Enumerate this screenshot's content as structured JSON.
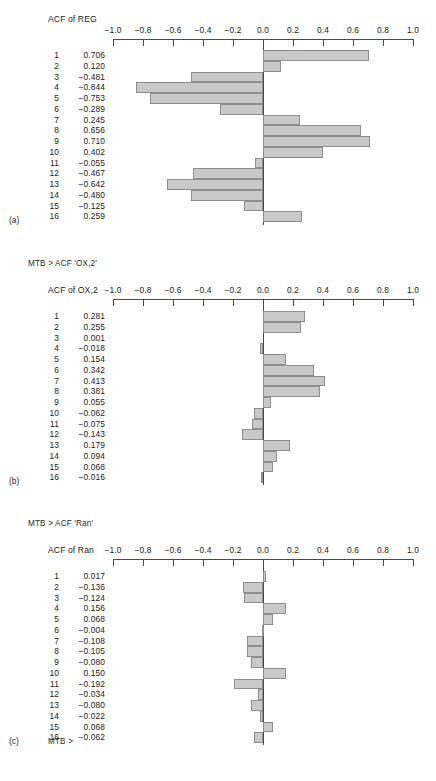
{
  "document": {
    "type": "minitab-acf-output",
    "axis": {
      "tick_labels": [
        "−1.0",
        "−0.8",
        "−0.6",
        "−0.4",
        "−0.2",
        "0.0",
        "0.2",
        "0.4",
        "0.6",
        "0.8",
        "1.0"
      ],
      "min": -1.0,
      "max": 1.0,
      "step": 0.2
    },
    "colors": {
      "bar_fill": "#c9c9c9",
      "bar_stroke": "#8e8e8e",
      "axis": "#4a4a4a",
      "text": "#1a1a1a"
    }
  },
  "panels": [
    {
      "letter": "(a)",
      "mtb_command": "",
      "axis_title": "ACF of REG",
      "chart_data": {
        "type": "bar",
        "orientation": "horizontal",
        "title": "ACF of REG",
        "xlabel": "",
        "ylabel": "Lag",
        "xlim": [
          -1.0,
          1.0
        ],
        "grid": false,
        "legend": "none",
        "categories": [
          "1",
          "2",
          "3",
          "4",
          "5",
          "6",
          "7",
          "8",
          "9",
          "10",
          "11",
          "12",
          "13",
          "14",
          "15",
          "16"
        ],
        "values": [
          0.706,
          0.12,
          -0.481,
          -0.844,
          -0.753,
          -0.289,
          0.245,
          0.656,
          0.71,
          0.402,
          -0.055,
          -0.467,
          -0.642,
          -0.48,
          -0.125,
          0.259
        ],
        "value_labels": [
          "0.706",
          "0.120",
          "−0.481",
          "−0.844",
          "−0.753",
          "−0.289",
          "0.245",
          "0.656",
          "0.710",
          "0.402",
          "−0.055",
          "−0.467",
          "−0.642",
          "−0.480",
          "−0.125",
          "0.259"
        ]
      }
    },
    {
      "letter": "(b)",
      "mtb_command": "MTB > ACF 'OX,2'",
      "axis_title": "ACF of OX,2",
      "chart_data": {
        "type": "bar",
        "orientation": "horizontal",
        "title": "ACF of OX,2",
        "xlabel": "",
        "ylabel": "Lag",
        "xlim": [
          -1.0,
          1.0
        ],
        "grid": false,
        "legend": "none",
        "categories": [
          "1",
          "2",
          "3",
          "4",
          "5",
          "6",
          "7",
          "8",
          "9",
          "10",
          "11",
          "12",
          "13",
          "14",
          "15",
          "16"
        ],
        "values": [
          0.281,
          0.255,
          0.001,
          -0.018,
          0.154,
          0.342,
          0.413,
          0.381,
          0.055,
          -0.062,
          -0.075,
          -0.143,
          0.179,
          0.094,
          0.068,
          -0.016
        ],
        "value_labels": [
          "0.281",
          "0.255",
          "0.001",
          "−0.018",
          "0.154",
          "0.342",
          "0.413",
          "0.381",
          "0.055",
          "−0.062",
          "−0.075",
          "−0.143",
          "0.179",
          "0.094",
          "0.068",
          "−0.016"
        ]
      }
    },
    {
      "letter": "(c)",
      "mtb_command": "MTB > ACF 'Ran'",
      "axis_title": "ACF of Ran",
      "footer_command": "MTB >",
      "chart_data": {
        "type": "bar",
        "orientation": "horizontal",
        "title": "ACF of Ran",
        "xlabel": "",
        "ylabel": "Lag",
        "xlim": [
          -1.0,
          1.0
        ],
        "grid": false,
        "legend": "none",
        "categories": [
          "1",
          "2",
          "3",
          "4",
          "5",
          "6",
          "7",
          "8",
          "9",
          "10",
          "11",
          "12",
          "13",
          "14",
          "15",
          "16"
        ],
        "values": [
          0.017,
          -0.136,
          -0.124,
          0.156,
          0.068,
          -0.004,
          -0.108,
          -0.105,
          -0.08,
          0.15,
          -0.192,
          -0.034,
          -0.08,
          -0.022,
          0.068,
          -0.062
        ],
        "value_labels": [
          "0.017",
          "−0.136",
          "−0.124",
          "0.156",
          "0.068",
          "−0.004",
          "−0.108",
          "−0.105",
          "−0.080",
          "0.150",
          "−0.192",
          "−0.034",
          "−0.080",
          "−0.022",
          "0.068",
          "−0.062"
        ]
      }
    }
  ]
}
